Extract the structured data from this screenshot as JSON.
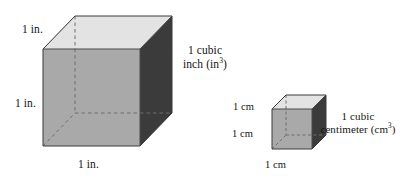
{
  "figure": {
    "background_color": "#ffffff",
    "text_color": "#141414"
  },
  "palette": {
    "top_face": "#e3e3e3",
    "bottom_face": "#d9d9d9",
    "front_face": "#a9a9a9",
    "left_face": "#8e8e8e",
    "right_face": "#3b3b3b",
    "edge_line": "#5a5a5a",
    "hidden_edge_line": "#6e6e6e",
    "outline": "#2e2e2e"
  },
  "large_cube": {
    "name": "cubic-inch-cube",
    "unit": "in.",
    "labels": {
      "depth": "1 in.",
      "height": "1 in.",
      "width": "1 in."
    },
    "caption_line1": "1 cubic",
    "caption_line2_prefix": "inch (in",
    "caption_exponent": "3",
    "caption_line2_suffix": ")"
  },
  "small_cube": {
    "name": "cubic-centimeter-cube",
    "unit": "cm",
    "labels": {
      "depth": "1 cm",
      "height": "1 cm",
      "width": "1 cm"
    },
    "caption_line1": "1 cubic",
    "caption_line2_prefix": "centimeter (cm",
    "caption_exponent": "3",
    "caption_line2_suffix": ")"
  }
}
